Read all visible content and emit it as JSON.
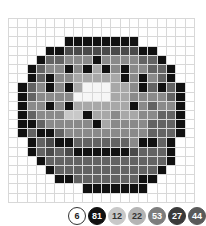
{
  "puzzle": {
    "columns": 20,
    "rows": 20,
    "grid": [
      "00000000000000000000",
      "00000000000000000000",
      "00000011111111000000",
      "00001155555555110000",
      "00016644414444661000",
      "00164414131414466100",
      "00161443333314146100",
      "01641413WWW334161610",
      "0164444WWWW334444610",
      "01441413333331464410",
      "01644422133433446610",
      "01164444413444466610",
      "01611644444444466610",
      "00165116666664116100",
      "00165651111115666100",
      "00016666666666666100",
      "00001666666666661000",
      "00000116666666110000",
      "00000000111111100000",
      "00000000000000000000"
    ]
  },
  "palette": [
    {
      "key": "W",
      "label": "6",
      "color": "#ffffff",
      "text_color": "#222222",
      "border": "#333333"
    },
    {
      "key": "1",
      "label": "81",
      "color": "#111111",
      "text_color": "#ffffff",
      "border": "#111111"
    },
    {
      "key": "2",
      "label": "12",
      "color": "#c8c8c8",
      "text_color": "#333333",
      "border": "#c8c8c8"
    },
    {
      "key": "3",
      "label": "22",
      "color": "#b4b4b4",
      "text_color": "#333333",
      "border": "#b4b4b4"
    },
    {
      "key": "4",
      "label": "53",
      "color": "#7d7d7d",
      "text_color": "#ffffff",
      "border": "#7d7d7d"
    },
    {
      "key": "5",
      "label": "27",
      "color": "#3a3a3a",
      "text_color": "#ffffff",
      "border": "#3a3a3a"
    },
    {
      "key": "6",
      "label": "44",
      "color": "#5a5a5a",
      "text_color": "#ffffff",
      "border": "#5a5a5a"
    }
  ],
  "cell_colors": {
    "0": "#ffffff",
    "1": "#111111",
    "2": "#c8c8c8",
    "3": "#a8a8a8",
    "4": "#8a8a8a",
    "5": "#4a4a4a",
    "6": "#636363",
    "W": "#f6f6f6"
  }
}
